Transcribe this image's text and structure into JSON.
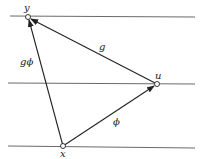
{
  "diagram": {
    "nodes": [
      {
        "id": "y",
        "label": "y",
        "x": 28,
        "y": 17
      },
      {
        "id": "u",
        "label": "u",
        "x": 157,
        "y": 84
      },
      {
        "id": "x",
        "label": "x",
        "x": 63,
        "y": 146
      }
    ],
    "edges": [
      {
        "from": "x",
        "to": "y",
        "label": "gϕ"
      },
      {
        "from": "u",
        "to": "y",
        "label": "g"
      },
      {
        "from": "x",
        "to": "u",
        "label": "ϕ"
      }
    ],
    "horizontal_lines": [
      16,
      83,
      147
    ],
    "colors": {
      "line": "#333333",
      "node_fill": "#ffffff",
      "background": "#ffffff"
    }
  }
}
